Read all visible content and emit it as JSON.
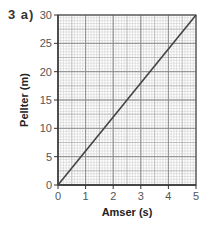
{
  "question": {
    "label": "3 a)"
  },
  "chart_data": {
    "type": "line",
    "title": "",
    "xlabel": "Amser (s)",
    "ylabel": "Pellter (m)",
    "xlim": [
      0,
      5
    ],
    "ylim": [
      0,
      30
    ],
    "xticks": [
      0,
      1,
      2,
      3,
      4,
      5
    ],
    "yticks": [
      0,
      5,
      10,
      15,
      20,
      25,
      30
    ],
    "grid": true,
    "legend": null,
    "series": [
      {
        "name": "distance-time",
        "x": [
          0,
          5
        ],
        "y": [
          0,
          30
        ],
        "color": "#444444"
      }
    ]
  },
  "colors": {
    "major_grid": "#8a8a8a",
    "minor_grid": "#c8c8c8",
    "axis": "#333333",
    "line": "#444444"
  }
}
